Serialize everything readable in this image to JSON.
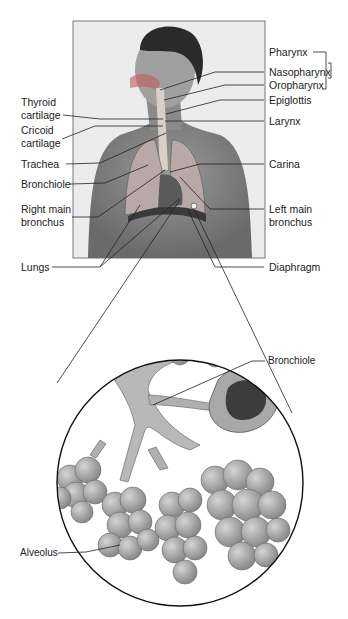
{
  "figure": {
    "labels_right": {
      "pharynx": "Pharynx",
      "nasopharynx": "Nasopharynx",
      "oropharynx": "Oropharynx",
      "epiglottis": "Epiglottis",
      "larynx": "Larynx",
      "carina": "Carina",
      "left_main_bronchus_1": "Left main",
      "left_main_bronchus_2": "bronchus",
      "diaphragm": "Diaphragm"
    },
    "labels_left": {
      "thyroid_1": "Thyroid",
      "thyroid_2": "cartilage",
      "cricoid_1": "Cricoid",
      "cricoid_2": "cartilage",
      "trachea": "Trachea",
      "bronchiole": "Bronchiole",
      "right_main_bronchus_1": "Right main",
      "right_main_bronchus_2": "bronchus",
      "lungs": "Lungs"
    },
    "inset": {
      "bronchiole": "Bronchiole",
      "alveolus": "Alveolus"
    }
  }
}
